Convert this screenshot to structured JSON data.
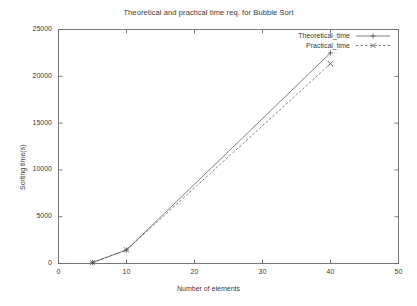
{
  "chart_data": {
    "type": "line",
    "title": "Theoretical and practical time req. for Bubble Sort",
    "xlabel": "Number of elements",
    "ylabel": "Sorting time(s)",
    "xlim": [
      0,
      50
    ],
    "ylim": [
      0,
      25000
    ],
    "xticks": [
      0,
      10,
      20,
      30,
      40,
      50
    ],
    "yticks": [
      0,
      5000,
      10000,
      15000,
      20000,
      25000
    ],
    "xtick_labels": [
      "0",
      "10",
      "20",
      "30",
      "40",
      "50"
    ],
    "ytick_labels": [
      "0",
      "5000",
      "10000",
      "15000",
      "20000",
      "25000"
    ],
    "grid": false,
    "legend_position": "top-right",
    "series": [
      {
        "name": "Theoretical_time",
        "marker": "plus",
        "linestyle": "solid",
        "color": "#555555",
        "x": [
          5,
          10,
          40
        ],
        "values": [
          100,
          1450,
          22500
        ]
      },
      {
        "name": "Practical_time",
        "marker": "cross",
        "linestyle": "dashed",
        "color": "#555555",
        "x": [
          5,
          10,
          40
        ],
        "values": [
          100,
          1450,
          21350
        ]
      }
    ]
  },
  "axis": {
    "frame_color": "#6b6b6b"
  }
}
